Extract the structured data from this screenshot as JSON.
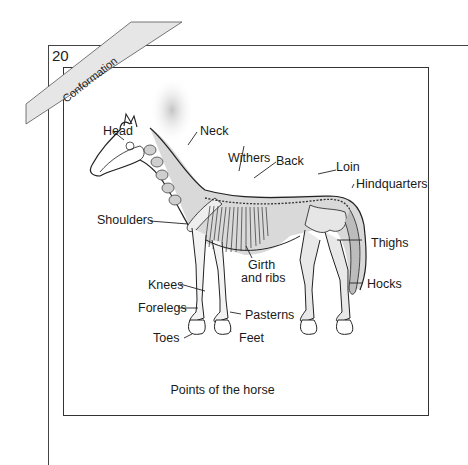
{
  "page": {
    "number": "20",
    "section_banner": "Conformation"
  },
  "figure": {
    "caption": "Points of the horse",
    "labels": {
      "head": "Head",
      "neck": "Neck",
      "withers": "Withers",
      "back": "Back",
      "loin": "Loin",
      "hindquarters": "Hindquarters",
      "shoulders": "Shoulders",
      "girth_line1": "Girth",
      "girth_line2": "and ribs",
      "thighs": "Thighs",
      "knees": "Knees",
      "forelegs": "Forelegs",
      "pasterns": "Pasterns",
      "hocks": "Hocks",
      "toes": "Toes",
      "feet": "Feet"
    }
  }
}
